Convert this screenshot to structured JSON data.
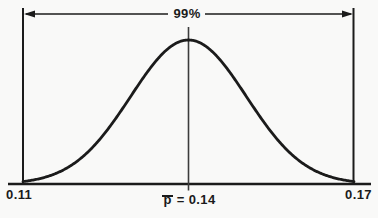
{
  "figure": {
    "background": "#f9f9f8",
    "ink": "#1b1b1b",
    "mean_line_color": "#3c3c3c"
  },
  "chart_data": {
    "type": "line",
    "curve": "normal-distribution",
    "title": "",
    "annotation": "99%",
    "confidence_level_pct": 99,
    "mean": 0.14,
    "mean_label": "p̄ = 0.14",
    "lower_bound": 0.11,
    "upper_bound": 0.17,
    "x_tick_labels": [
      "0.11",
      "p̄ = 0.14",
      "0.17"
    ],
    "z_at_bounds": 2.576,
    "grid": false,
    "legend": false,
    "y_axis_labels": "none"
  },
  "labels": {
    "interval": "99%",
    "x_left": "0.11",
    "x_right": "0.17",
    "mean_symbol": "p",
    "mean_eq": "= 0.14"
  }
}
